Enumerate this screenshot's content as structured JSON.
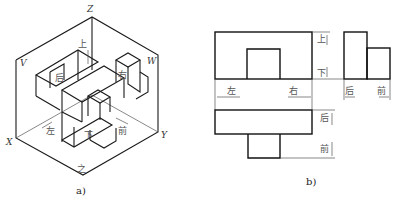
{
  "figure_a": {
    "caption": "a)",
    "axes": {
      "x": "X",
      "y": "Y",
      "z": "Z"
    },
    "planes": {
      "v": "V",
      "w": "W"
    },
    "directions": {
      "up": "上",
      "down": "下",
      "left": "左",
      "right": "右",
      "back": "后",
      "front": "前",
      "bottom_mark": "之"
    }
  },
  "figure_b": {
    "caption": "b)",
    "front_view": {
      "left": "左",
      "right": "右",
      "up": "上",
      "down": "下"
    },
    "side_view": {
      "back": "后",
      "front": "前"
    },
    "top_view": {
      "back": "后",
      "front": "前"
    }
  }
}
